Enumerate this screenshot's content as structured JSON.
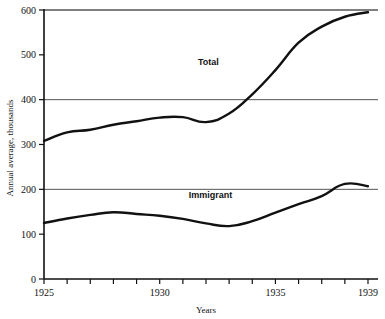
{
  "chart_data": {
    "type": "line",
    "title": "",
    "xlabel": "Years",
    "ylabel": "Annual average, thousands",
    "xlim": [
      1925,
      1939
    ],
    "ylim": [
      0,
      600
    ],
    "grid": "horizontal gridlines at 200, 400, 600",
    "legend": "inline series labels on plot",
    "x": [
      1925,
      1926,
      1927,
      1928,
      1929,
      1930,
      1931,
      1932,
      1933,
      1934,
      1935,
      1936,
      1937,
      1938,
      1939
    ],
    "xticks": [
      1925,
      1926,
      1927,
      1928,
      1929,
      1930,
      1931,
      1932,
      1933,
      1934,
      1935,
      1936,
      1937,
      1938,
      1939
    ],
    "xtick_labels": [
      "1925",
      "",
      "",
      "",
      "",
      "1930",
      "",
      "",
      "",
      "",
      "1935",
      "",
      "",
      "",
      "1939"
    ],
    "yticks": [
      0,
      100,
      200,
      300,
      400,
      500,
      600
    ],
    "ytick_labels": [
      "0",
      "100",
      "200",
      "300",
      "400",
      "500",
      "600"
    ],
    "series": [
      {
        "name": "Total",
        "label_x": 1932.1,
        "label_y": 478,
        "color": "#111111",
        "values": [
          308,
          327,
          333,
          344,
          352,
          360,
          361,
          350,
          369,
          412,
          466,
          527,
          563,
          585,
          595
        ]
      },
      {
        "name": "Immigrant",
        "label_x": 1932.2,
        "label_y": 181,
        "color": "#111111",
        "values": [
          125,
          135,
          143,
          149,
          145,
          141,
          134,
          124,
          118,
          129,
          148,
          167,
          185,
          212,
          207
        ]
      }
    ]
  },
  "axis": {
    "ylabel": "Annual average, thousands",
    "xlabel": "Years"
  },
  "colors": {
    "line": "#111111",
    "axis": "#111111",
    "grid": "#555555",
    "background": "#ffffff"
  }
}
